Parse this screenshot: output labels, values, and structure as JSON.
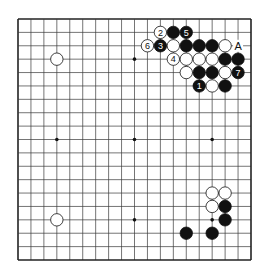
{
  "diagram": {
    "type": "go-board",
    "size": 19,
    "colors": {
      "line": "#3a3a3a",
      "border": "#222222",
      "black": "#111111",
      "white": "#ffffff",
      "background": "#ffffff"
    },
    "hoshi": [
      [
        3,
        3
      ],
      [
        9,
        3
      ],
      [
        15,
        3
      ],
      [
        3,
        9
      ],
      [
        9,
        9
      ],
      [
        15,
        9
      ],
      [
        3,
        15
      ],
      [
        9,
        15
      ],
      [
        15,
        15
      ]
    ],
    "stones": [
      {
        "col": 11,
        "row": 1,
        "color": "white",
        "label": "2"
      },
      {
        "col": 12,
        "row": 1,
        "color": "black",
        "label": ""
      },
      {
        "col": 13,
        "row": 1,
        "color": "black",
        "label": "5"
      },
      {
        "col": 10,
        "row": 2,
        "color": "white",
        "label": "6"
      },
      {
        "col": 11,
        "row": 2,
        "color": "black",
        "label": "3"
      },
      {
        "col": 12,
        "row": 2,
        "color": "white",
        "label": ""
      },
      {
        "col": 13,
        "row": 2,
        "color": "black",
        "label": ""
      },
      {
        "col": 14,
        "row": 2,
        "color": "black",
        "label": ""
      },
      {
        "col": 15,
        "row": 2,
        "color": "black",
        "label": ""
      },
      {
        "col": 16,
        "row": 2,
        "color": "white",
        "label": ""
      },
      {
        "col": 12,
        "row": 3,
        "color": "white",
        "label": "4"
      },
      {
        "col": 13,
        "row": 3,
        "color": "white",
        "label": ""
      },
      {
        "col": 14,
        "row": 3,
        "color": "white",
        "label": ""
      },
      {
        "col": 15,
        "row": 3,
        "color": "white",
        "label": ""
      },
      {
        "col": 16,
        "row": 3,
        "color": "black",
        "label": ""
      },
      {
        "col": 17,
        "row": 3,
        "color": "black",
        "label": ""
      },
      {
        "col": 13,
        "row": 4,
        "color": "white",
        "label": ""
      },
      {
        "col": 14,
        "row": 4,
        "color": "black",
        "label": ""
      },
      {
        "col": 15,
        "row": 4,
        "color": "black",
        "label": ""
      },
      {
        "col": 16,
        "row": 4,
        "color": "white",
        "label": ""
      },
      {
        "col": 17,
        "row": 4,
        "color": "black",
        "label": "7"
      },
      {
        "col": 14,
        "row": 5,
        "color": "black",
        "label": "1"
      },
      {
        "col": 15,
        "row": 5,
        "color": "white",
        "label": ""
      },
      {
        "col": 16,
        "row": 5,
        "color": "black",
        "label": ""
      },
      {
        "col": 3,
        "row": 3,
        "color": "white",
        "label": ""
      },
      {
        "col": 3,
        "row": 15,
        "color": "white",
        "label": ""
      },
      {
        "col": 15,
        "row": 13,
        "color": "white",
        "label": ""
      },
      {
        "col": 16,
        "row": 13,
        "color": "white",
        "label": ""
      },
      {
        "col": 15,
        "row": 14,
        "color": "white",
        "label": ""
      },
      {
        "col": 16,
        "row": 14,
        "color": "black",
        "label": ""
      },
      {
        "col": 16,
        "row": 15,
        "color": "black",
        "label": ""
      },
      {
        "col": 13,
        "row": 16,
        "color": "black",
        "label": ""
      },
      {
        "col": 15,
        "row": 16,
        "color": "black",
        "label": ""
      }
    ],
    "markers": [
      {
        "col": 17,
        "row": 2,
        "label": "A"
      }
    ]
  }
}
